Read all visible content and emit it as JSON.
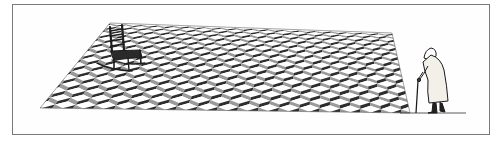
{
  "illustration": {
    "description": "Cartoon: an illusory tumbling-blocks (isometric cube) patterned carpet floor with an empty rocking chair on its far corner, viewed by an elderly hunched woman with a cane standing at its right edge",
    "colors": {
      "frame": "#7a7a7a",
      "tile_light": "#ffffff",
      "tile_mid": "#9a9a9a",
      "tile_dark": "#2e2e2e",
      "ink": "#1a1a1a"
    },
    "elements": [
      "patterned-floor",
      "rocking-chair",
      "elderly-woman",
      "cane",
      "ground-line"
    ]
  }
}
